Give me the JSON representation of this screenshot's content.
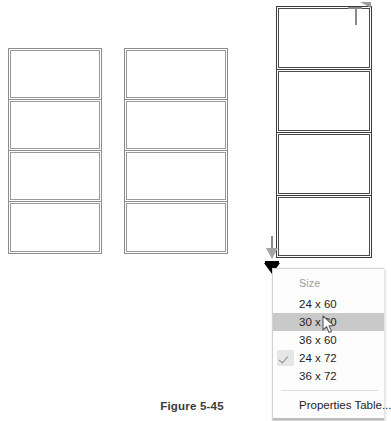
{
  "figure": {
    "caption": "Figure 5-45"
  },
  "drawing": {
    "groups": [
      {
        "name": "curtain-wall-left",
        "selected": false,
        "panel_count": 4,
        "panel_labels": [
          "panel-1",
          "panel-2",
          "panel-3",
          "panel-4"
        ]
      },
      {
        "name": "curtain-wall-middle",
        "selected": false,
        "panel_count": 4,
        "panel_labels": [
          "panel-1",
          "panel-2",
          "panel-3",
          "panel-4"
        ]
      },
      {
        "name": "curtain-wall-right",
        "selected": true,
        "panel_count": 4,
        "panel_labels": [
          "panel-1",
          "panel-2",
          "panel-3",
          "panel-4"
        ]
      }
    ],
    "handles": {
      "top_right_icon": "triangle-drag-handle-icon",
      "bottom_left_icon": "triangle-drag-handle-icon",
      "dropdown_icon": "black-triangle-dropdown-icon"
    }
  },
  "size_menu": {
    "header": "Size",
    "items": [
      {
        "label": "24 x 60",
        "checked": false,
        "highlighted": false
      },
      {
        "label": "30 x 60",
        "checked": false,
        "highlighted": true
      },
      {
        "label": "36 x 60",
        "checked": false,
        "highlighted": false
      },
      {
        "label": "24 x 72",
        "checked": true,
        "highlighted": false
      },
      {
        "label": "36 x 72",
        "checked": false,
        "highlighted": false
      }
    ],
    "footer_item": "Properties Table...",
    "check_icon": "checkmark-icon",
    "highlight_color": "#c9c9c9",
    "header_color": "#9b9b9b"
  },
  "cursor": {
    "icon": "mouse-pointer-icon",
    "x": 322,
    "y": 315
  }
}
